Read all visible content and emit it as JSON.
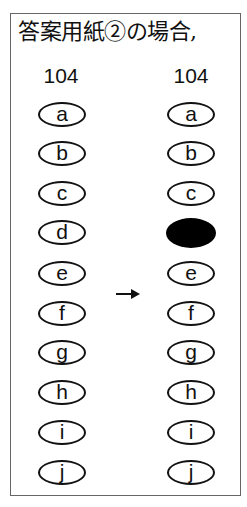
{
  "title": "答案用紙②の場合,",
  "left_column": {
    "number": "104",
    "options": [
      {
        "label": "a",
        "filled": false
      },
      {
        "label": "b",
        "filled": false
      },
      {
        "label": "c",
        "filled": false
      },
      {
        "label": "d",
        "filled": false
      },
      {
        "label": "e",
        "filled": false
      },
      {
        "label": "f",
        "filled": false
      },
      {
        "label": "g",
        "filled": false
      },
      {
        "label": "h",
        "filled": false
      },
      {
        "label": "i",
        "filled": false
      },
      {
        "label": "j",
        "filled": false
      }
    ]
  },
  "right_column": {
    "number": "104",
    "options": [
      {
        "label": "a",
        "filled": false
      },
      {
        "label": "b",
        "filled": false
      },
      {
        "label": "c",
        "filled": false
      },
      {
        "label": "",
        "filled": true
      },
      {
        "label": "e",
        "filled": false
      },
      {
        "label": "f",
        "filled": false
      },
      {
        "label": "g",
        "filled": false
      },
      {
        "label": "h",
        "filled": false
      },
      {
        "label": "i",
        "filled": false
      },
      {
        "label": "j",
        "filled": false
      }
    ]
  },
  "arrow": "→",
  "colors": {
    "ink": "#111111",
    "border": "#666666",
    "background": "#ffffff"
  }
}
